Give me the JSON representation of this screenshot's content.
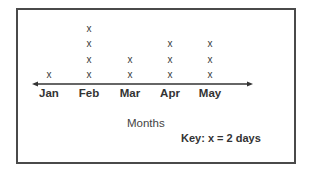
{
  "chart_data": {
    "type": "dot_plot",
    "title": "",
    "xlabel": "Months",
    "ylabel": "",
    "categories": [
      "Jan",
      "Feb",
      "Mar",
      "Apr",
      "May"
    ],
    "values": [
      1,
      4,
      2,
      3,
      3
    ],
    "mark_symbol": "x",
    "key": "Key: x = 2 days",
    "key_value_per_mark": 2,
    "key_unit": "days",
    "days_per_month": [
      2,
      8,
      4,
      6,
      6
    ],
    "grid": false,
    "legend_position": "bottom-right",
    "axis": {
      "arrows": "both-ends"
    }
  },
  "labels": {
    "xlabel": "Months",
    "key": "Key: x = 2 days",
    "mark": "x"
  },
  "colors": {
    "frame": "#4a4a4a",
    "axis": "#333333",
    "text": "#333333"
  }
}
